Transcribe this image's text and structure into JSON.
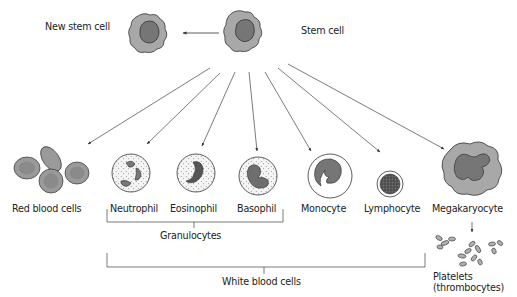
{
  "diagram": {
    "colors": {
      "cytoplasm": "#a8a8a8",
      "nucleus": "#767676",
      "outline": "#333333",
      "rbc": "#9a9a9a",
      "rbc_center": "#8a8a8a",
      "granule": "#555555",
      "line": "#444444"
    },
    "nodes": {
      "new_stem_cell": {
        "label": "New stem cell"
      },
      "stem_cell": {
        "label": "Stem cell"
      },
      "red_blood_cells": {
        "label": "Red blood cells"
      },
      "neutrophil": {
        "label": "Neutrophil"
      },
      "eosinophil": {
        "label": "Eosinophil"
      },
      "basophil": {
        "label": "Basophil"
      },
      "monocyte": {
        "label": "Monocyte"
      },
      "lymphocyte": {
        "label": "Lymphocyte"
      },
      "megakaryocyte": {
        "label": "Megakaryocyte"
      },
      "platelets": {
        "label_line1": "Platelets",
        "label_line2": "(thrombocytes)"
      }
    },
    "groups": {
      "granulocytes": {
        "label": "Granulocytes",
        "members": [
          "Neutrophil",
          "Eosinophil",
          "Basophil"
        ]
      },
      "white_blood_cells": {
        "label": "White blood cells",
        "members": [
          "Neutrophil",
          "Eosinophil",
          "Basophil",
          "Monocyte",
          "Lymphocyte"
        ]
      }
    },
    "edges": [
      {
        "from": "Stem cell",
        "to": "New stem cell"
      },
      {
        "from": "Stem cell",
        "to": "Red blood cells"
      },
      {
        "from": "Stem cell",
        "to": "Neutrophil"
      },
      {
        "from": "Stem cell",
        "to": "Eosinophil"
      },
      {
        "from": "Stem cell",
        "to": "Basophil"
      },
      {
        "from": "Stem cell",
        "to": "Monocyte"
      },
      {
        "from": "Stem cell",
        "to": "Lymphocyte"
      },
      {
        "from": "Stem cell",
        "to": "Megakaryocyte"
      },
      {
        "from": "Megakaryocyte",
        "to": "Platelets (thrombocytes)"
      }
    ]
  }
}
